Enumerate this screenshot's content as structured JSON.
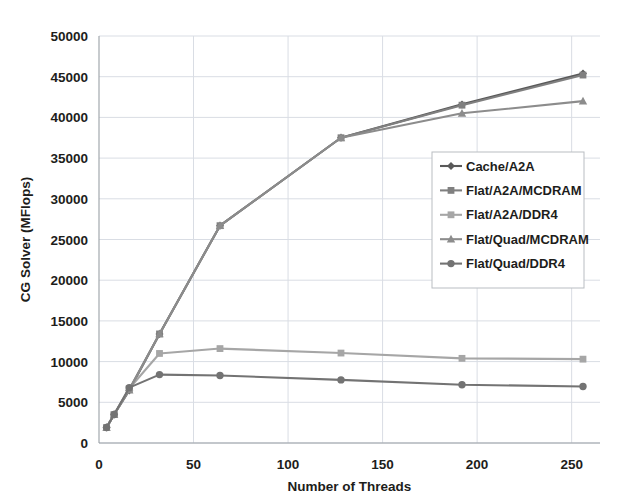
{
  "chart_data": {
    "type": "line",
    "title": "",
    "xlabel": "Number of Threads",
    "ylabel": "CG Solver (MFlops)",
    "xlim": [
      0,
      265
    ],
    "ylim": [
      0,
      50000
    ],
    "xticks": [
      0,
      50,
      100,
      150,
      200,
      250
    ],
    "yticks": [
      0,
      5000,
      10000,
      15000,
      20000,
      25000,
      30000,
      35000,
      40000,
      45000,
      50000
    ],
    "grid": true,
    "legend_position": "center-right",
    "x": [
      4,
      8,
      16,
      32,
      64,
      128,
      192,
      256
    ],
    "series": [
      {
        "name": "Cache/A2A",
        "marker": "diamond",
        "color": "#595959",
        "values": [
          1900,
          3500,
          6450,
          13400,
          26700,
          37500,
          41600,
          45400
        ]
      },
      {
        "name": "Flat/A2A/MCDRAM",
        "marker": "square",
        "color": "#808080",
        "values": [
          1900,
          3500,
          6600,
          13400,
          26700,
          37500,
          41500,
          45200
        ]
      },
      {
        "name": "Flat/A2A/DDR4",
        "marker": "square",
        "color": "#a6a6a6",
        "values": [
          1900,
          3500,
          6700,
          11000,
          11600,
          11050,
          10400,
          10300
        ]
      },
      {
        "name": "Flat/Quad/MCDRAM",
        "marker": "triangle",
        "color": "#8c8c8c",
        "values": [
          1900,
          3500,
          6500,
          13400,
          26700,
          37500,
          40500,
          42000
        ]
      },
      {
        "name": "Flat/Quad/DDR4",
        "marker": "circle",
        "color": "#737373",
        "values": [
          1900,
          3500,
          6800,
          8400,
          8300,
          7750,
          7150,
          6950
        ]
      }
    ],
    "xtick_labels": [
      "0",
      "50",
      "100",
      "150",
      "200",
      "250"
    ],
    "ytick_labels": [
      "0",
      "5000",
      "10000",
      "15000",
      "20000",
      "25000",
      "30000",
      "35000",
      "40000",
      "45000",
      "50000"
    ]
  },
  "legend": {
    "items": [
      {
        "label": "Cache/A2A"
      },
      {
        "label": "Flat/A2A/MCDRAM"
      },
      {
        "label": "Flat/A2A/DDR4"
      },
      {
        "label": "Flat/Quad/MCDRAM"
      },
      {
        "label": "Flat/Quad/DDR4"
      }
    ]
  }
}
